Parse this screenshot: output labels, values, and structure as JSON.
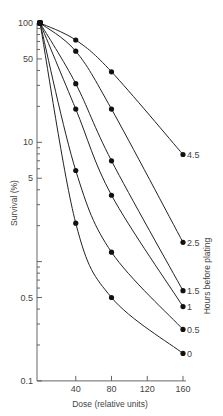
{
  "chart_data": {
    "type": "line",
    "title": "",
    "xlabel": "Dose (relative units)",
    "ylabel": "Survival (%)",
    "right_label": "Hours before plating",
    "yscale": "log",
    "ylim": [
      0.1,
      100
    ],
    "xlim": [
      0,
      160
    ],
    "x_ticks": [
      40,
      80,
      120,
      160
    ],
    "y_ticks": [
      {
        "value": 100,
        "label": "100"
      },
      {
        "value": 50,
        "label": "50"
      },
      {
        "value": 10,
        "label": "10"
      },
      {
        "value": 5,
        "label": "5"
      },
      {
        "value": 0.5,
        "label": "0.5"
      },
      {
        "value": 0.1,
        "label": "0.1"
      }
    ],
    "x": [
      0,
      40,
      80,
      160
    ],
    "series": [
      {
        "name": "4.5",
        "values": [
          100,
          72,
          39,
          7.9
        ]
      },
      {
        "name": "2.5",
        "values": [
          100,
          58,
          19,
          1.45
        ]
      },
      {
        "name": "1.5",
        "values": [
          100,
          31,
          7,
          0.57
        ]
      },
      {
        "name": "1",
        "values": [
          100,
          19,
          3.6,
          0.42
        ]
      },
      {
        "name": "0.5",
        "values": [
          100,
          5.8,
          1.2,
          0.27
        ]
      },
      {
        "name": "0",
        "values": [
          100,
          2.1,
          0.5,
          0.17
        ]
      }
    ],
    "grid": false,
    "legend": "inline labels at curve ends"
  }
}
